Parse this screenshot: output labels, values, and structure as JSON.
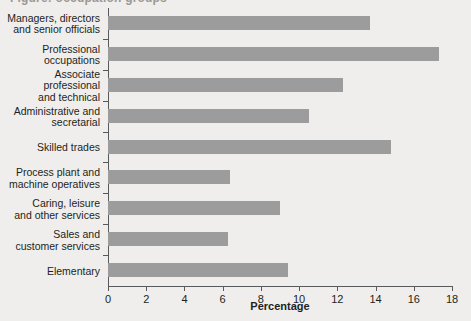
{
  "top_clipped_text": "Figure: occupation groups",
  "chart_data": {
    "type": "bar",
    "orientation": "horizontal",
    "title": "",
    "xlabel": "Percentage",
    "ylabel": "",
    "xlim": [
      0,
      18
    ],
    "xticks": [
      0,
      2,
      4,
      6,
      8,
      10,
      12,
      14,
      16,
      18
    ],
    "grid": false,
    "legend": null,
    "bar_color": "#9c9c9c",
    "background_color": "#efeeec",
    "axis_color": "#58595b",
    "categories": [
      "Managers, directors and senior officials",
      "Professional occupations",
      "Associate professional and technical",
      "Administrative and secretarial",
      "Skilled trades",
      "Process plant and machine operatives",
      "Caring, leisure and other services",
      "Sales and customer services",
      "Elementary"
    ],
    "category_lines": [
      [
        "Managers, directors",
        "and senior officials"
      ],
      [
        "Professional",
        "occupations"
      ],
      [
        "Associate",
        "professional",
        "and technical"
      ],
      [
        "Administrative and",
        "secretarial"
      ],
      [
        "Skilled trades"
      ],
      [
        "Process plant and",
        "machine operatives"
      ],
      [
        "Caring, leisure",
        "and other services"
      ],
      [
        "Sales and",
        "customer services"
      ],
      [
        "Elementary"
      ]
    ],
    "values": [
      13.7,
      17.3,
      12.3,
      10.5,
      14.8,
      6.4,
      9.0,
      6.3,
      9.4
    ]
  }
}
